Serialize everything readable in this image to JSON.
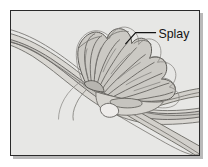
{
  "figure": {
    "kind": "geomorphology-diagram",
    "background_color": "#e7e7e5",
    "border_color": "#2a2a2a",
    "shadow_color": "#b9b9b9",
    "line_color": "#5a5a58",
    "fill_light": "#dedcd8",
    "fill_mid": "#cfcdc8",
    "fill_dark": "#bcbab5",
    "annotations": [
      {
        "id": "splay",
        "label": "Splay",
        "leader_from": [
          115,
          32
        ],
        "leader_to": [
          128,
          22
        ],
        "leader_end": [
          146,
          22
        ],
        "text_anchor": [
          150,
          27
        ]
      }
    ],
    "features": {
      "main_channel_label": "main channel",
      "splay_fan_label": "crevasse splay fan",
      "distributary_label": "distributary channel"
    }
  }
}
